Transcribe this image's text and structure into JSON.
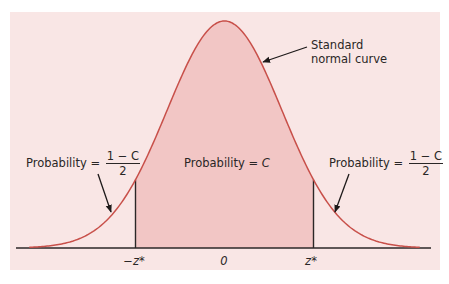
{
  "figure": {
    "colors": {
      "background": "#ffffff",
      "panel": "#f9e6e5",
      "shaded_region": "#f2c6c5",
      "curve": "#c8504a",
      "axis": "#2b2727",
      "text": "#2a2626"
    },
    "curve_label": {
      "line1": "Standard",
      "line2": "normal curve"
    },
    "center_label": {
      "text": "Probability = ",
      "symbol": "C"
    },
    "left_tail_label": {
      "text": "Probability = ",
      "numerator": "1 − C",
      "denominator": "2"
    },
    "right_tail_label": {
      "text": "Probability = ",
      "numerator": "1 − C",
      "denominator": "2"
    },
    "axis_labels": {
      "left": "−z*",
      "center": "0",
      "right": "z*"
    }
  },
  "chart_data": {
    "type": "area",
    "title": "Standard normal curve",
    "distribution": "standard normal N(0,1)",
    "x_range": [
      -3.4,
      3.4
    ],
    "critical_values": {
      "lower": "-z*",
      "upper": "z*",
      "approx_z": 1.55
    },
    "shaded_region": {
      "from": "-z*",
      "to": "z*",
      "probability": "C"
    },
    "tail_regions": [
      {
        "side": "left",
        "probability": "(1 - C)/2"
      },
      {
        "side": "right",
        "probability": "(1 - C)/2"
      }
    ],
    "tick_labels": [
      "−z*",
      "0",
      "z*"
    ],
    "annotations": [
      "Standard normal curve",
      "Probability = C",
      "Probability = (1 − C)/2",
      "Probability = (1 − C)/2"
    ],
    "grid": false,
    "legend": null
  }
}
